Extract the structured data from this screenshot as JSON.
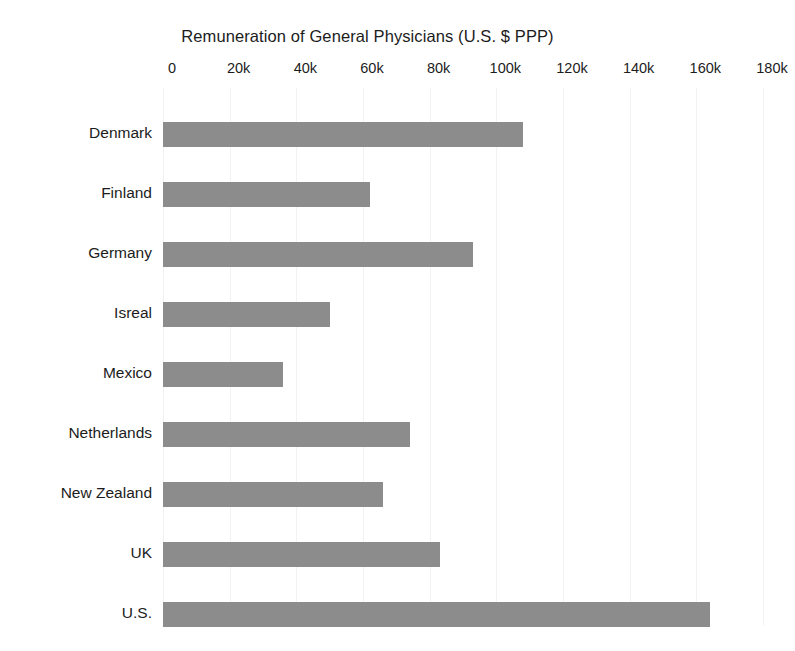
{
  "chart_data": {
    "type": "bar",
    "orientation": "horizontal",
    "title": "Remuneration of General Physicians (U.S. $ PPP)",
    "xlabel": "",
    "ylabel": "",
    "categories": [
      "Denmark",
      "Finland",
      "Germany",
      "Isreal",
      "Mexico",
      "Netherlands",
      "New Zealand",
      "UK",
      "U.S."
    ],
    "values": [
      108000,
      62000,
      93000,
      50000,
      36000,
      74000,
      66000,
      83000,
      164000
    ],
    "xlim": [
      0,
      180000
    ],
    "xticks": [
      0,
      20000,
      40000,
      60000,
      80000,
      100000,
      120000,
      140000,
      160000,
      180000
    ],
    "xtick_labels": [
      "0",
      "20k",
      "40k",
      "60k",
      "80k",
      "100k",
      "120k",
      "140k",
      "160k",
      "180k"
    ],
    "grid": true,
    "grid_axis": "x",
    "legend": false,
    "bar_color": "#8c8c8c",
    "grid_color": "#f2f2f2",
    "text_color": "#1c1c1c",
    "background_color": "#ffffff"
  }
}
